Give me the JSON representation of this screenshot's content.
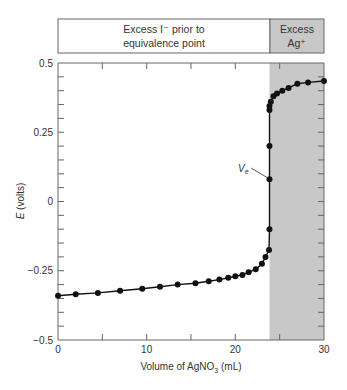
{
  "header": {
    "left_label_line1": "Excess I⁻ prior to",
    "left_label_line2": "equivalence point",
    "right_label_line1": "Excess",
    "right_label_line2": "Ag⁺"
  },
  "annotation": {
    "label": "V",
    "subscript": "e"
  },
  "colors": {
    "shade": "#c8c8c8",
    "line": "#111111",
    "axis": "#555555"
  },
  "chart_data": {
    "type": "line",
    "title": "",
    "xlabel": "Volume of AgNO3 (mL)",
    "ylabel": "E (volts)",
    "xlim": [
      0,
      30
    ],
    "ylim": [
      -0.5,
      0.5
    ],
    "x_ticks": [
      0,
      10,
      20,
      30
    ],
    "x_tick_labels": [
      "0",
      "10",
      "20",
      "30"
    ],
    "y_ticks": [
      0.5,
      0.25,
      0,
      -0.25,
      -0.5
    ],
    "y_tick_labels": [
      "0.5",
      "0.25",
      "0",
      "−0.25",
      "−0.5"
    ],
    "grid": false,
    "legend": null,
    "shaded_region": {
      "x_start": 23.85,
      "x_end": 30,
      "label": "Excess Ag+"
    },
    "equivalence_volume_label": "Ve",
    "series": [
      {
        "name": "E vs volume",
        "x": [
          0,
          2,
          4.5,
          7,
          9.5,
          11.5,
          13.5,
          15.5,
          17,
          18.2,
          19.2,
          20,
          20.8,
          21.5,
          22.3,
          23,
          23.4,
          23.8,
          23.85,
          23.85,
          23.85,
          23.85,
          23.85,
          24,
          24.3,
          24.7,
          25.3,
          26,
          27,
          28.2,
          30
        ],
        "y": [
          -0.34,
          -0.335,
          -0.33,
          -0.322,
          -0.315,
          -0.308,
          -0.3,
          -0.295,
          -0.288,
          -0.282,
          -0.275,
          -0.27,
          -0.265,
          -0.255,
          -0.245,
          -0.225,
          -0.2,
          -0.175,
          -0.1,
          0.08,
          0.2,
          0.33,
          0.345,
          0.36,
          0.38,
          0.39,
          0.4,
          0.41,
          0.425,
          0.43,
          0.435
        ]
      }
    ]
  }
}
